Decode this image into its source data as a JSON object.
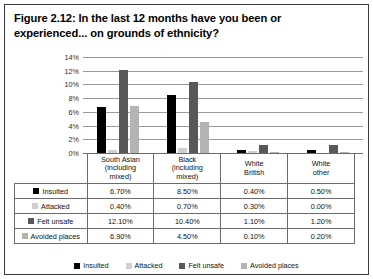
{
  "figure": {
    "title": "Figure 2.12: In the last 12 months have you been or experienced... on grounds of ethnicity?"
  },
  "chart_data": {
    "type": "bar",
    "title": "Figure 2.12: In the last 12 months have you been or experienced... on grounds of ethnicity?",
    "xlabel": "",
    "ylabel": "",
    "ylim": [
      0,
      14
    ],
    "yticks": [
      "0%",
      "2%",
      "4%",
      "6%",
      "8%",
      "10%",
      "12%",
      "14%"
    ],
    "grid": true,
    "legend_position": "bottom",
    "categories": [
      "South Asian (including mixed)",
      "Black (including mixed)",
      "White British",
      "White other"
    ],
    "category_lines": [
      [
        "South Asian",
        "(including",
        "mixed)"
      ],
      [
        "Black",
        "(including",
        "mixed)"
      ],
      [
        "White",
        "British"
      ],
      [
        "White",
        "other"
      ]
    ],
    "series": [
      {
        "name": "Insulted",
        "color": "#000000",
        "values": [
          6.7,
          8.5,
          0.4,
          0.5
        ],
        "labels": [
          "6.70%",
          "8.50%",
          "0.40%",
          "0.50%"
        ]
      },
      {
        "name": "Attacked",
        "color": "#cfcfcf",
        "values": [
          0.4,
          0.7,
          0.3,
          0.0
        ],
        "labels": [
          "0.40%",
          "0.70%",
          "0.30%",
          "0.00%"
        ]
      },
      {
        "name": "Felt unsafe",
        "color": "#585858",
        "values": [
          12.1,
          10.4,
          1.1,
          1.2
        ],
        "labels": [
          "12.10%",
          "10.40%",
          "1.10%",
          "1.20%"
        ]
      },
      {
        "name": "Avoided places",
        "color": "#b4b4b4",
        "values": [
          6.9,
          4.5,
          0.1,
          0.2
        ],
        "labels": [
          "6.90%",
          "4.50%",
          "0.10%",
          "0.20%"
        ]
      }
    ]
  }
}
